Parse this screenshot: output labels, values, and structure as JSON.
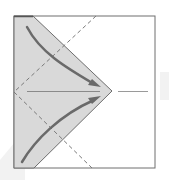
{
  "diagram": {
    "type": "origami-fold-diagram",
    "colors": {
      "background": "#ffffff",
      "paper_shaded": "#d9d9d9",
      "outline": "#6e6e6e",
      "dashed": "#7a7a7a",
      "arrow": "#6a6a6a",
      "watermark": "#eeeeee"
    },
    "elements": {
      "square": "paper-square",
      "shaded_flap": "folded-flap",
      "valley_fold_top": "dashed-fold-line-top",
      "valley_fold_bottom": "dashed-fold-line-bottom",
      "center_crease": "center-crease-line",
      "arrow_top": "fold-arrow-top",
      "arrow_bottom": "fold-arrow-bottom"
    }
  }
}
